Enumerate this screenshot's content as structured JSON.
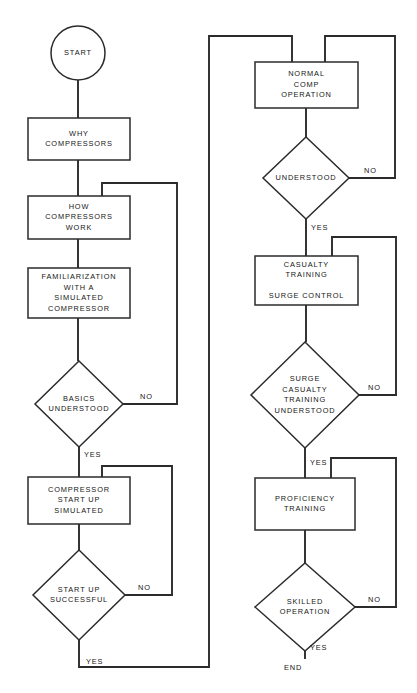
{
  "diagram": {
    "canvas": {
      "width": 417,
      "height": 693
    },
    "colors": {
      "background": "#ffffff",
      "stroke": "#2b2b2b",
      "text": "#161616",
      "shape_fill": "#ffffff"
    },
    "nodes": [
      {
        "id": "start",
        "type": "terminator-circle",
        "label": "START",
        "lines": [
          "START"
        ],
        "cx": 78,
        "cy": 53,
        "r": 27
      },
      {
        "id": "why-compressors",
        "type": "process",
        "label": "WHY COMPRESSORS",
        "lines": [
          "WHY",
          "COMPRESSORS"
        ],
        "x": 28,
        "y": 118,
        "w": 102,
        "h": 42
      },
      {
        "id": "how-compressors-work",
        "type": "process",
        "label": "HOW COMPRESSORS WORK",
        "lines": [
          "HOW",
          "COMPRESSORS",
          "WORK"
        ],
        "x": 28,
        "y": 196,
        "w": 102,
        "h": 43
      },
      {
        "id": "familiarization",
        "type": "process",
        "label": "FAMILIARIZATION WITH A SIMULATED COMPRESSOR",
        "lines": [
          "FAMILIARIZATION",
          "WITH A",
          "SIMULATED",
          "COMPRESSOR"
        ],
        "x": 28,
        "y": 268,
        "w": 102,
        "h": 50
      },
      {
        "id": "basics-understood",
        "type": "decision",
        "label": "BASICS UNDERSTOOD",
        "lines": [
          "BASICS",
          "UNDERSTOOD"
        ],
        "cx": 79,
        "cy": 404,
        "rx": 44,
        "ry": 43
      },
      {
        "id": "compressor-start-up-simulated",
        "type": "process",
        "label": "COMPRESSOR START UP SIMULATED",
        "lines": [
          "COMPRESSOR",
          "START UP",
          "SIMULATED"
        ],
        "x": 28,
        "y": 477,
        "w": 102,
        "h": 47
      },
      {
        "id": "start-up-successful",
        "type": "decision",
        "label": "START UP SUCCESSFUL",
        "lines": [
          "START UP",
          "SUCCESSFUL"
        ],
        "cx": 79,
        "cy": 595,
        "rx": 46,
        "ry": 45
      },
      {
        "id": "normal-comp-operation",
        "type": "process",
        "label": "NORMAL COMP OPERATION",
        "lines": [
          "NORMAL",
          "COMP",
          "OPERATION"
        ],
        "x": 255,
        "y": 62,
        "w": 103,
        "h": 46
      },
      {
        "id": "understood",
        "type": "decision",
        "label": "UNDERSTOOD",
        "lines": [
          "UNDERSTOOD"
        ],
        "cx": 306,
        "cy": 178,
        "rx": 43,
        "ry": 41
      },
      {
        "id": "casualty-training-surge-control",
        "type": "process",
        "label": "CASUALTY TRAINING SURGE CONTROL",
        "lines": [
          "CASUALTY",
          "TRAINING",
          "",
          "SURGE CONTROL"
        ],
        "x": 255,
        "y": 256,
        "w": 103,
        "h": 49
      },
      {
        "id": "surge-casualty-training-understood",
        "type": "decision",
        "label": "SURGE CASUALTY TRAINING UNDERSTOOD",
        "lines": [
          "SURGE",
          "CASUALTY",
          "TRAINING",
          "UNDERSTOOD"
        ],
        "cx": 305,
        "cy": 395,
        "rx": 54,
        "ry": 53
      },
      {
        "id": "proficiency-training",
        "type": "process",
        "label": "PROFICIENCY TRAINING",
        "lines": [
          "PROFICIENCY",
          "TRAINING"
        ],
        "x": 255,
        "y": 478,
        "w": 100,
        "h": 52
      },
      {
        "id": "skilled-operation",
        "type": "decision",
        "label": "SKILLED OPERATION",
        "lines": [
          "SKILLED",
          "OPERATION"
        ],
        "cx": 305,
        "cy": 607,
        "rx": 50,
        "ry": 44
      },
      {
        "id": "end",
        "type": "terminator-text",
        "label": "END",
        "lines": [
          "END"
        ],
        "cx": 293,
        "cy": 668
      }
    ],
    "connectors": [
      {
        "id": "start-to-why",
        "from": "start",
        "to": "why-compressors",
        "points": "78,80 78,118"
      },
      {
        "id": "why-to-how",
        "from": "why-compressors",
        "to": "how-compressors-work",
        "points": "78,160 78,196"
      },
      {
        "id": "how-to-familiarization",
        "from": "how-compressors-work",
        "to": "familiarization",
        "points": "78,239 78,268"
      },
      {
        "id": "familiarization-to-basics",
        "from": "familiarization",
        "to": "basics-understood",
        "points": "78,318 78,361"
      },
      {
        "id": "basics-no-loop",
        "from": "basics-understood",
        "to": "how-compressors-work",
        "label": "NO",
        "points": "123,404 177,404 177,183 102,183 102,196"
      },
      {
        "id": "basics-yes-to-compressor-start",
        "from": "basics-understood",
        "to": "compressor-start-up-simulated",
        "label": "YES",
        "points": "79,447 79,477"
      },
      {
        "id": "compressor-start-to-successful",
        "from": "compressor-start-up-simulated",
        "to": "start-up-successful",
        "points": "79,524 79,550"
      },
      {
        "id": "startup-no-loop",
        "from": "start-up-successful",
        "to": "compressor-start-up-simulated",
        "label": "NO",
        "points": "125,595 172,595 172,466 102,466 102,477"
      },
      {
        "id": "startup-yes-to-normal-op",
        "from": "start-up-successful",
        "to": "normal-comp-operation",
        "label": "YES",
        "points": "79,640 79,667 209,667 209,36 292,36 292,62"
      },
      {
        "id": "normal-op-to-understood",
        "from": "normal-comp-operation",
        "to": "understood",
        "points": "306,108 306,137"
      },
      {
        "id": "understood-no-loop",
        "from": "understood",
        "to": "normal-comp-operation",
        "label": "NO",
        "points": "349,178 395,178 395,36 325,36 325,62"
      },
      {
        "id": "understood-yes-to-casualty",
        "from": "understood",
        "to": "casualty-training-surge-control",
        "label": "YES",
        "points": "306,219 306,256"
      },
      {
        "id": "casualty-to-surge-decision",
        "from": "casualty-training-surge-control",
        "to": "surge-casualty-training-understood",
        "points": "306,305 306,342"
      },
      {
        "id": "surge-no-loop",
        "from": "surge-casualty-training-understood",
        "to": "casualty-training-surge-control",
        "label": "NO",
        "points": "359,395 396,395 396,237 332,237 332,256"
      },
      {
        "id": "surge-yes-to-proficiency",
        "from": "surge-casualty-training-understood",
        "to": "proficiency-training",
        "label": "YES",
        "points": "305,448 305,478"
      },
      {
        "id": "proficiency-to-skilled",
        "from": "proficiency-training",
        "to": "skilled-operation",
        "points": "305,530 305,563"
      },
      {
        "id": "skilled-no-loop",
        "from": "skilled-operation",
        "to": "proficiency-training",
        "label": "NO",
        "points": "355,607 396,607 396,458 331,458 331,478"
      },
      {
        "id": "skilled-yes-to-end",
        "from": "skilled-operation",
        "to": "end",
        "label": "YES",
        "points": "305,651 305,659"
      }
    ],
    "edge_labels": [
      {
        "id": "basics-no-label",
        "text": "NO",
        "x": 140,
        "y": 397,
        "anchor": "start"
      },
      {
        "id": "basics-yes-label",
        "text": "YES",
        "x": 84,
        "y": 455,
        "anchor": "start"
      },
      {
        "id": "startup-no-label",
        "text": "NO",
        "x": 138,
        "y": 588,
        "anchor": "start"
      },
      {
        "id": "startup-yes-label",
        "text": "YES",
        "x": 86,
        "y": 662,
        "anchor": "start"
      },
      {
        "id": "understood-no-label",
        "text": "NO",
        "x": 364,
        "y": 171,
        "anchor": "start"
      },
      {
        "id": "understood-yes-label",
        "text": "YES",
        "x": 311,
        "y": 228,
        "anchor": "start"
      },
      {
        "id": "surge-no-label",
        "text": "NO",
        "x": 368,
        "y": 388,
        "anchor": "start"
      },
      {
        "id": "surge-yes-label",
        "text": "YES",
        "x": 310,
        "y": 463,
        "anchor": "start"
      },
      {
        "id": "skilled-no-label",
        "text": "NO",
        "x": 368,
        "y": 600,
        "anchor": "start"
      },
      {
        "id": "skilled-yes-label",
        "text": "YES",
        "x": 310,
        "y": 648,
        "anchor": "start"
      }
    ]
  }
}
